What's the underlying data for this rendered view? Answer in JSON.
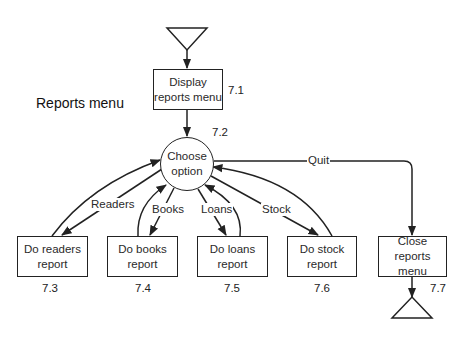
{
  "diagram": {
    "title": "Reports menu",
    "processes": [
      {
        "id": "7.1",
        "label_line1": "Display",
        "label_line2": "reports menu"
      },
      {
        "id": "7.2",
        "label_line1": "Choose",
        "label_line2": "option"
      },
      {
        "id": "7.3",
        "label_line1": "Do readers",
        "label_line2": "report"
      },
      {
        "id": "7.4",
        "label_line1": "Do books",
        "label_line2": "report"
      },
      {
        "id": "7.5",
        "label_line1": "Do loans",
        "label_line2": "report"
      },
      {
        "id": "7.6",
        "label_line1": "Do stock",
        "label_line2": "report"
      },
      {
        "id": "7.7",
        "label_line1": "Close",
        "label_line2": "reports menu"
      }
    ],
    "flows": {
      "readers": "Readers",
      "books": "Books",
      "loans": "Loans",
      "stock": "Stock",
      "quit": "Quit"
    },
    "colors": {
      "stroke": "#222222",
      "background": "#ffffff"
    }
  }
}
